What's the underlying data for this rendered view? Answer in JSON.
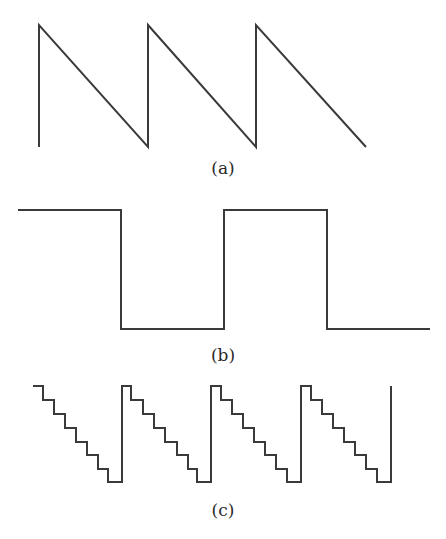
{
  "figure": {
    "panels": [
      {
        "id": "a",
        "label": "(a)",
        "waveform": "sawtooth-falling",
        "periods": 3,
        "points": "39,147 39,25 148,147 148,25 256,147 256,25 366,147",
        "label_pos": {
          "x": 223,
          "y": 174
        }
      },
      {
        "id": "b",
        "label": "(b)",
        "waveform": "square",
        "points": "18,210 121,210 121,329 224,329 224,210 327,210 327,329 430,329",
        "label_pos": {
          "x": 223,
          "y": 361
        }
      },
      {
        "id": "c",
        "label": "(c)",
        "waveform": "staircase-falling",
        "periods": 4,
        "steps_per_period": 8,
        "points": "33,386 43,386 43,400 54,400 54,414 65,414 65,428 76,428 76,442 87,442 87,455 98,455 98,469 108,469 108,482 122,482 122,386 131,386 131,400 143,400 143,414 154,414 154,428 165,428 165,442 177,442 177,455 188,455 188,469 197,469 197,482 211,482 211,386 221,386 221,400 232,400 232,414 243,414 243,428 254,428 254,442 265,442 265,455 276,455 276,469 287,469 287,482 301,482 301,386 311,386 311,400 322,400 322,414 333,414 333,428 344,428 344,442 355,442 355,455 366,455 366,469 377,469 377,482 391,482 391,386",
        "label_pos": {
          "x": 223,
          "y": 516
        }
      }
    ],
    "colors": {
      "stroke": "#3a3a3a",
      "text": "#2a2a2a",
      "background": "#ffffff"
    }
  }
}
